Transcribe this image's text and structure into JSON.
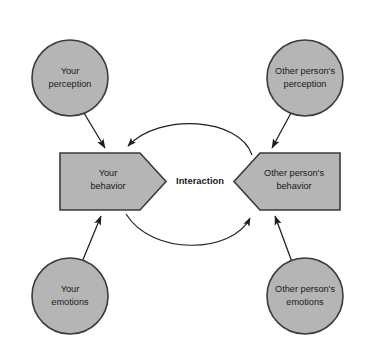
{
  "diagram": {
    "background_color": "#ffffff",
    "shape_fill_color": "#b5b5b5",
    "shape_stroke_color": "#3b3b3b",
    "connector_color": "#1d1d1d",
    "center_label": "Interaction",
    "nodes": [
      {
        "id": "your-perception",
        "shape": "circle",
        "line1": "Your",
        "line2": "perception",
        "cx": 70,
        "cy": 78,
        "r": 38
      },
      {
        "id": "other-person-perception",
        "shape": "circle",
        "line1": "Other person's",
        "line2": "perception",
        "cx": 305,
        "cy": 78,
        "r": 38
      },
      {
        "id": "your-emotions",
        "shape": "circle",
        "line1": "Your",
        "line2": "emotions",
        "cx": 70,
        "cy": 296,
        "r": 38
      },
      {
        "id": "other-person-emotions",
        "shape": "circle",
        "line1": "Other person's",
        "line2": "emotions",
        "cx": 305,
        "cy": 296,
        "r": 38
      },
      {
        "id": "your-behavior",
        "shape": "chevron-right",
        "line1": "Your",
        "line2": "behavior",
        "cx": 110,
        "cy": 181
      },
      {
        "id": "other-person-behavior",
        "shape": "chevron-left",
        "line1": "Other person's",
        "line2": "behavior",
        "cx": 290,
        "cy": 181
      }
    ],
    "arrows": [
      {
        "id": "arrow-your-perception-to-your-behavior",
        "from": "your-perception",
        "to": "your-behavior",
        "style": "straight"
      },
      {
        "id": "arrow-other-perception-to-other-behavior",
        "from": "other-person-perception",
        "to": "other-person-behavior",
        "style": "straight"
      },
      {
        "id": "arrow-your-emotions-to-your-behavior",
        "from": "your-emotions",
        "to": "your-behavior",
        "style": "straight"
      },
      {
        "id": "arrow-other-emotions-to-other-behavior",
        "from": "other-person-emotions",
        "to": "other-person-behavior",
        "style": "straight"
      },
      {
        "id": "arc-other-behavior-to-your-behavior",
        "from": "other-person-behavior",
        "to": "your-behavior",
        "style": "curved-top"
      },
      {
        "id": "arc-your-behavior-to-other-behavior",
        "from": "your-behavior",
        "to": "other-person-behavior",
        "style": "curved-bottom"
      }
    ]
  }
}
